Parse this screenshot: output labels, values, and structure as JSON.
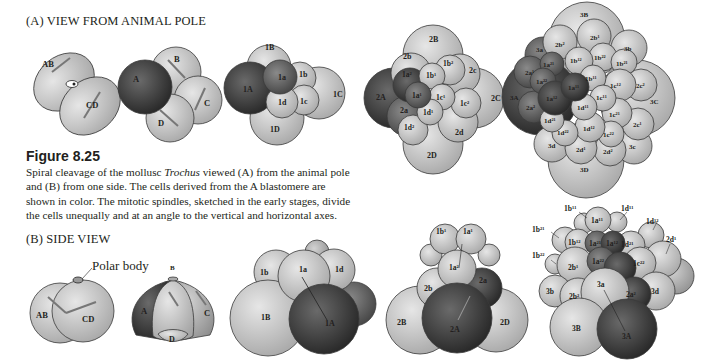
{
  "panel_a": {
    "title": "(A) VIEW FROM ANIMAL POLE"
  },
  "panel_b": {
    "title": "(B) SIDE VIEW",
    "polar_body_label": "Polar body"
  },
  "figure": {
    "label": "Figure 8.25",
    "caption_pre": "Spiral cleavage of the mollusc ",
    "caption_italic": "Trochus",
    "caption_post": " viewed (A) from the animal pole and (B) from one side. The cells derived from the A blastomere are shown in color. The mitotic spindles, sketched in the early stages, divide the cells unequally and at an angle to the vertical and horizontal axes."
  },
  "colors": {
    "a_lineage_dark": "#2e2e2e",
    "a_lineage_mid": "#5a5a5a",
    "cell_light": "#c8c8c8",
    "cell_mid": "#a9a9a9",
    "outline": "#3a3a3a"
  },
  "stages_a": [
    {
      "name": "2-cell",
      "cells": [
        "AB",
        "CD"
      ]
    },
    {
      "name": "4-cell",
      "cells": [
        "A",
        "B",
        "C",
        "D"
      ]
    },
    {
      "name": "8-cell",
      "cells": [
        "1A",
        "1B",
        "1C",
        "1D",
        "1a",
        "1b",
        "1c",
        "1d"
      ]
    },
    {
      "name": "16-cell",
      "cells": [
        "2A",
        "2B",
        "2C",
        "2D",
        "2a",
        "2b",
        "2c",
        "2d",
        "1a²",
        "1b²",
        "1c²",
        "1d²",
        "1a¹",
        "1b¹",
        "1c¹",
        "1d¹"
      ]
    },
    {
      "name": "late",
      "cells": [
        "3A",
        "3B",
        "3C",
        "3D",
        "3a",
        "3b",
        "3c",
        "3d",
        "2a²",
        "2a¹",
        "2b²",
        "2b¹",
        "2c²",
        "2c¹",
        "2d²",
        "2d¹",
        "1a¹¹",
        "1a¹²",
        "1a²¹",
        "1a²²",
        "1b¹¹",
        "1b¹²",
        "1b²¹",
        "1b²²",
        "1c¹¹",
        "1c¹²",
        "1c²¹",
        "1c²²",
        "1d¹¹",
        "1d¹²",
        "1d²¹",
        "1d²²"
      ]
    }
  ],
  "stages_b": [
    {
      "name": "2-cell side",
      "cells": [
        "AB",
        "CD"
      ]
    },
    {
      "name": "4-cell side",
      "cells": [
        "A",
        "B",
        "C",
        "D"
      ]
    },
    {
      "name": "8-cell side",
      "cells": [
        "1a",
        "1b",
        "1d",
        "1A",
        "1B"
      ]
    },
    {
      "name": "16-cell side",
      "cells": [
        "1b¹",
        "1a¹",
        "1a²",
        "2a",
        "2b",
        "2A",
        "2B",
        "2D"
      ]
    },
    {
      "name": "late side",
      "cells": [
        "1b¹¹",
        "1d¹¹",
        "1d¹²",
        "2d¹",
        "1b²¹",
        "1b¹²",
        "1a¹¹",
        "1a²¹",
        "1a¹²",
        "1d²¹",
        "1b²²",
        "2b¹",
        "1a²²",
        "1c²²",
        "3b",
        "2b²",
        "3a",
        "2a²",
        "3d",
        "3B",
        "3A"
      ]
    }
  ]
}
